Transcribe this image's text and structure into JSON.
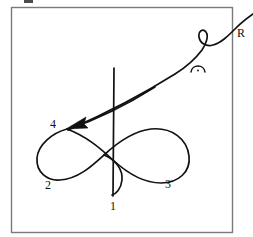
{
  "figure": {
    "stroke_color": "#111111",
    "frame_color": "#7a7a7a",
    "background": "#ffffff",
    "frame": {
      "x": 11,
      "y": 7,
      "width": 221,
      "height": 225
    }
  },
  "labels": {
    "region_1": "1",
    "region_2": "2",
    "region_3": "3",
    "vertex_4": "4",
    "ray_r": "R"
  },
  "label_positions": {
    "region_1": {
      "x": 112,
      "y": 203
    },
    "region_2": {
      "x": 47,
      "y": 183
    },
    "region_3": {
      "x": 167,
      "y": 181
    },
    "vertex_4": {
      "x": 53,
      "y": 122
    },
    "ray_r": {
      "x": 239,
      "y": 33
    }
  },
  "elements": {
    "closed_curve": "figure-eight shaped closed curve with left lobe (region 2) and right lobe (region 3)",
    "vertical_line": "straight vertical line through the curve near x=114, from y=68 to y=196",
    "ray": "ascending ray from vertex 4 to upper right, exits frame, labelled R",
    "small_loop": "small loop on the ray near the upper right",
    "arrowhead": "arrowhead at vertex 4 pointing down-left",
    "arc_mark": "small arc with dot below the ray",
    "bottom_hook": "small hook/cusp of the curve at bottom center near label 1"
  },
  "geometry": {
    "vertical_line": {
      "x": 114,
      "y_top": 68,
      "y_bottom": 196
    },
    "vertex_4_point": {
      "x": 66,
      "y": 128
    },
    "ray_exit": {
      "x": 253,
      "y": 22
    },
    "loop_center": {
      "x": 208,
      "y": 38
    },
    "arc_mark_center": {
      "x": 198,
      "y": 69
    }
  }
}
